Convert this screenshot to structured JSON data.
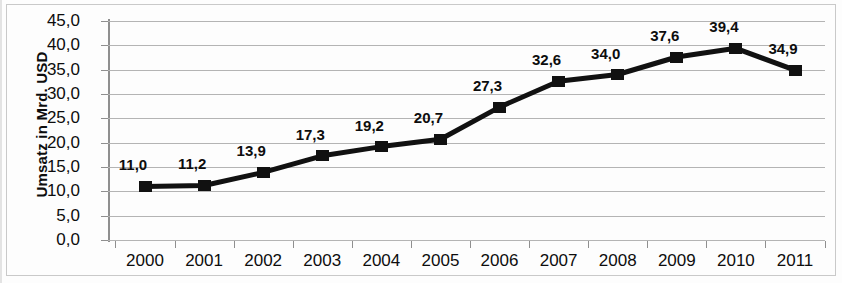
{
  "chart_data": {
    "type": "line",
    "title": "",
    "xlabel": "",
    "ylabel": "Umsatz in Mrd. USD",
    "categories": [
      "2000",
      "2001",
      "2002",
      "2003",
      "2004",
      "2005",
      "2006",
      "2007",
      "2008",
      "2009",
      "2010",
      "2011"
    ],
    "values": [
      11.0,
      11.2,
      13.9,
      17.3,
      19.2,
      20.7,
      27.3,
      32.6,
      34.0,
      37.6,
      39.4,
      34.9
    ],
    "point_labels": [
      "11,0",
      "11,2",
      "13,9",
      "17,3",
      "19,2",
      "20,7",
      "27,3",
      "32,6",
      "34,0",
      "37,6",
      "39,4",
      "34,9"
    ],
    "ylim": [
      0,
      45
    ],
    "ytick_values": [
      45,
      40,
      35,
      30,
      25,
      20,
      15,
      10,
      5,
      0
    ],
    "ytick_labels": [
      "45,0",
      "40,0",
      "35,0",
      "30,0",
      "25,0",
      "20,0",
      "15,0",
      "10,0",
      "5,0",
      "0,0"
    ],
    "grid": true,
    "legend": "none",
    "series_color": "#111111",
    "grid_color": "#b4b4b4",
    "axis_color": "#8f8f8f",
    "marker": "square"
  }
}
